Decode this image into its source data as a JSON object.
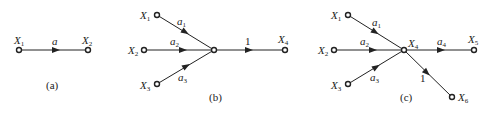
{
  "diagrams": [
    {
      "id": "a",
      "caption": "(a)",
      "nodes": [
        {
          "id": "X1",
          "label": "X",
          "sub": "1"
        },
        {
          "id": "X2",
          "label": "X",
          "sub": "2"
        }
      ],
      "edges": [
        {
          "from": "X1",
          "to": "X2",
          "gain": "a"
        }
      ]
    },
    {
      "id": "b",
      "caption": "(b)",
      "nodes": [
        {
          "id": "X1",
          "label": "X",
          "sub": "1"
        },
        {
          "id": "X2",
          "label": "X",
          "sub": "2"
        },
        {
          "id": "X3",
          "label": "X",
          "sub": "3"
        },
        {
          "id": "J",
          "label": "",
          "sub": ""
        },
        {
          "id": "X4",
          "label": "X",
          "sub": "4"
        }
      ],
      "edges": [
        {
          "from": "X1",
          "to": "J",
          "gain": "a",
          "gain_sub": "1"
        },
        {
          "from": "X2",
          "to": "J",
          "gain": "a",
          "gain_sub": "2"
        },
        {
          "from": "X3",
          "to": "J",
          "gain": "a",
          "gain_sub": "3"
        },
        {
          "from": "J",
          "to": "X4",
          "gain": "1"
        }
      ]
    },
    {
      "id": "c",
      "caption": "(c)",
      "nodes": [
        {
          "id": "X1",
          "label": "X",
          "sub": "1"
        },
        {
          "id": "X2",
          "label": "X",
          "sub": "2"
        },
        {
          "id": "X3",
          "label": "X",
          "sub": "3"
        },
        {
          "id": "X4",
          "label": "X",
          "sub": "4"
        },
        {
          "id": "X5",
          "label": "X",
          "sub": "5"
        },
        {
          "id": "X6",
          "label": "X",
          "sub": "6"
        }
      ],
      "edges": [
        {
          "from": "X1",
          "to": "X4",
          "gain": "a",
          "gain_sub": "1"
        },
        {
          "from": "X2",
          "to": "X4",
          "gain": "a",
          "gain_sub": "2"
        },
        {
          "from": "X3",
          "to": "X4",
          "gain": "a",
          "gain_sub": "3"
        },
        {
          "from": "X4",
          "to": "X5",
          "gain": "a",
          "gain_sub": "4"
        },
        {
          "from": "X4",
          "to": "X6",
          "gain": "1"
        }
      ]
    }
  ]
}
